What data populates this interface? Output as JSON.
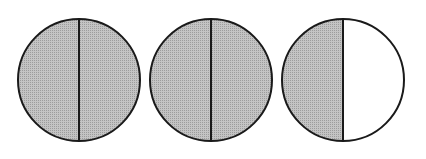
{
  "diagram": {
    "shade_color": "#b5b5b5",
    "stroke_color": "#1a1a1a",
    "circles": [
      {
        "id": "circle-1",
        "cx": 79,
        "cy": 80,
        "r": 61,
        "left_shaded": true,
        "right_shaded": true
      },
      {
        "id": "circle-2",
        "cx": 211,
        "cy": 80,
        "r": 61,
        "left_shaded": true,
        "right_shaded": true
      },
      {
        "id": "circle-3",
        "cx": 343,
        "cy": 80,
        "r": 61,
        "left_shaded": true,
        "right_shaded": false
      }
    ]
  }
}
